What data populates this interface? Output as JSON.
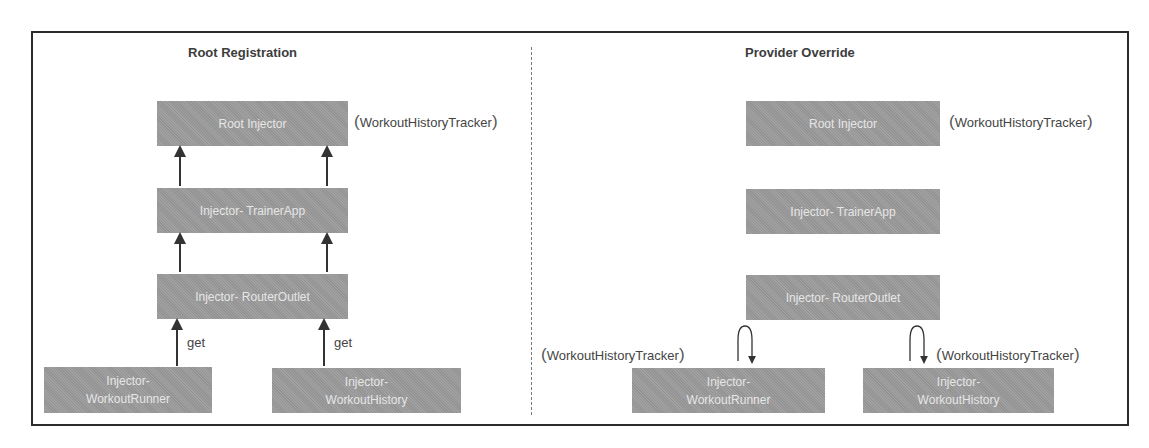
{
  "panels": {
    "left": {
      "title": "Root Registration",
      "boxes": {
        "root": "Root Injector",
        "trainer_app": "Injector- TrainerApp",
        "router_outlet": "Injector- RouterOutlet",
        "workout_runner_line1": "Injector-",
        "workout_runner_line2": "WorkoutRunner",
        "workout_history_line1": "Injector-",
        "workout_history_line2": "WorkoutHistory"
      },
      "provider_note": "WorkoutHistoryTracker",
      "edge_labels": {
        "runner_get": "get",
        "history_get": "get"
      }
    },
    "right": {
      "title": "Provider Override",
      "boxes": {
        "root": "Root Injector",
        "trainer_app": "Injector- TrainerApp",
        "router_outlet": "Injector- RouterOutlet",
        "workout_runner_line1": "Injector-",
        "workout_runner_line2": "WorkoutRunner",
        "workout_history_line1": "Injector-",
        "workout_history_line2": "WorkoutHistory"
      },
      "root_note": "WorkoutHistoryTracker",
      "runner_note": "WorkoutHistoryTracker",
      "history_note": "WorkoutHistoryTracker"
    }
  },
  "colors": {
    "box_fill": "#9b9b9b",
    "box_text": "#e6e6e6",
    "line": "#333333"
  }
}
